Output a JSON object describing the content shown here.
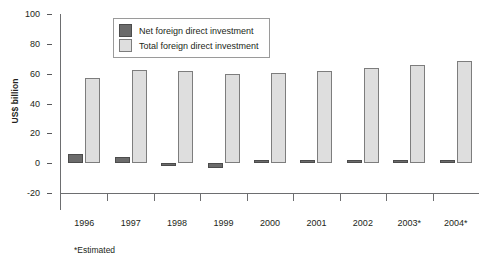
{
  "chart_data": {
    "type": "bar",
    "title": "",
    "subtitle": "",
    "xlabel": "",
    "ylabel": "US$ billion",
    "ylim": [
      -20,
      100
    ],
    "yticks": [
      -20,
      0,
      20,
      40,
      60,
      80,
      100
    ],
    "ytick_labels": [
      "-20",
      "0",
      "20",
      "40",
      "60",
      "80",
      "100"
    ],
    "grid": false,
    "legend_position": "top-center",
    "categories": [
      "1996",
      "1997",
      "1998",
      "1999",
      "2000",
      "2001",
      "2002",
      "2003*",
      "2004*"
    ],
    "series": [
      {
        "name": "Net foreign direct investment",
        "color": "#6b6b6b",
        "values": [
          6,
          4,
          -0.5,
          -3,
          1,
          0.8,
          1.2,
          2,
          2.2
        ]
      },
      {
        "name": "Total foreign direct investment",
        "color": "#dedede",
        "values": [
          57,
          62.5,
          62,
          59.5,
          60.5,
          62,
          63.5,
          65.5,
          68.5
        ]
      }
    ],
    "annotations": [
      "*Estimated"
    ]
  },
  "legend": {
    "entries": [
      {
        "label": "Net foreign direct investment"
      },
      {
        "label": "Total foreign direct investment"
      }
    ]
  },
  "footnote": "*Estimated"
}
